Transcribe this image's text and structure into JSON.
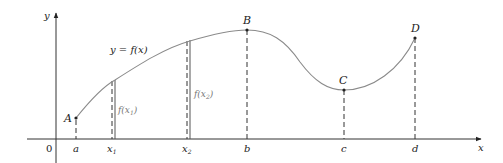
{
  "axes": {
    "y_label": "y",
    "x_label": "x",
    "origin_label": "0"
  },
  "curve": {
    "equation_label": "y = f(x)"
  },
  "points": [
    {
      "name": "A",
      "x": 76,
      "y": 118
    },
    {
      "name": "B",
      "x": 247,
      "y": 30
    },
    {
      "name": "C",
      "x": 344,
      "y": 90
    },
    {
      "name": "D",
      "x": 415,
      "y": 38
    }
  ],
  "x_ticks": {
    "a": "a",
    "x1": "x",
    "x1_sub": "1",
    "x2": "x",
    "x2_sub": "2",
    "b": "b",
    "c": "c",
    "d": "d"
  },
  "function_values": {
    "fx1_prefix": "f(x",
    "fx1_sub": "1",
    "fx1_suffix": ")",
    "fx2_prefix": "f(x",
    "fx2_sub": "2",
    "fx2_suffix": ")"
  },
  "colors": {
    "curve": "#8a8a8a",
    "axis": "#333333",
    "dash": "#333333"
  }
}
